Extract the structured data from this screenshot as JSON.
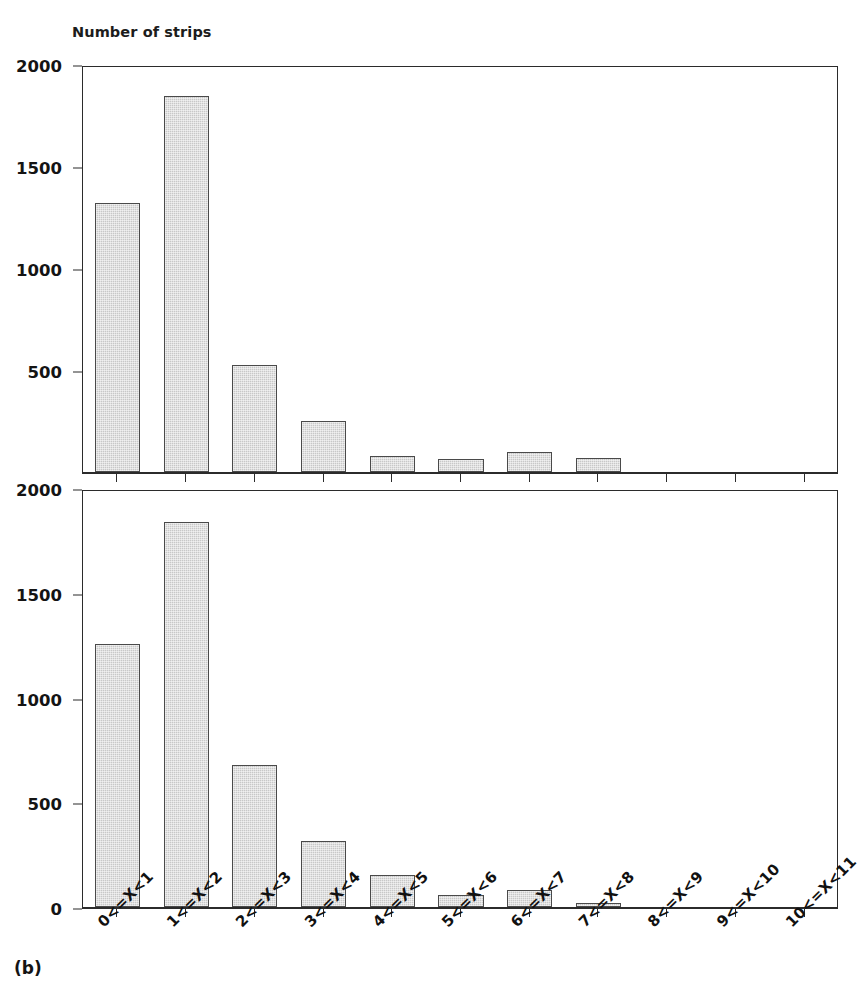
{
  "figure": {
    "panel_letter": "(b)",
    "axis_title": "Number of strips",
    "bar_fill_color": "#c8c8c8",
    "bar_edge_color": "#4a4a4a",
    "axis_color": "#2b2b2b"
  },
  "chart_data": [
    {
      "type": "bar",
      "id": "panel-top",
      "title": "Number of strips",
      "xlabel": "",
      "ylabel": "Number of strips",
      "categories": [
        "0<=X<1",
        "1<=X<2",
        "2<=X<3",
        "3<=X<4",
        "4<=X<5",
        "5<=X<6",
        "6<=X<7",
        "7<=X<8",
        "8<=X<9",
        "9<=X<10",
        "10<=X<11"
      ],
      "values": [
        1320,
        1845,
        525,
        250,
        80,
        65,
        100,
        70,
        0,
        0,
        0
      ],
      "ylim": [
        0,
        2000
      ],
      "yticks": [
        2000,
        1500,
        1000,
        500
      ],
      "ytick_labels": [
        "2000",
        "1500",
        "1000",
        "500"
      ],
      "grid": false,
      "legend": null
    },
    {
      "type": "bar",
      "id": "panel-bottom",
      "title": "",
      "xlabel": "",
      "ylabel": "Number of strips",
      "categories": [
        "0<=X<1",
        "1<=X<2",
        "2<=X<3",
        "3<=X<4",
        "4<=X<5",
        "5<=X<6",
        "6<=X<7",
        "7<=X<8",
        "8<=X<9",
        "9<=X<10",
        "10<=X<11"
      ],
      "values": [
        1255,
        1840,
        680,
        315,
        155,
        55,
        80,
        20,
        0,
        0,
        0
      ],
      "ylim": [
        0,
        2000
      ],
      "yticks": [
        2000,
        1500,
        1000,
        500,
        0
      ],
      "ytick_labels": [
        "2000",
        "1500",
        "1000",
        "500",
        "0"
      ],
      "grid": false,
      "legend": null
    }
  ]
}
